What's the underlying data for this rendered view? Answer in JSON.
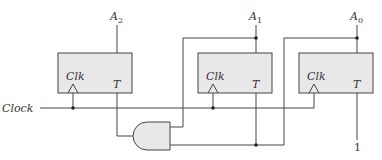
{
  "diagram": {
    "type": "logic-circuit",
    "clock_label": "Clock",
    "flip_flops": [
      {
        "output_name": "A",
        "output_sub": "2",
        "clk_label": "Clk",
        "input_label": "T"
      },
      {
        "output_name": "A",
        "output_sub": "1",
        "clk_label": "Clk",
        "input_label": "T"
      },
      {
        "output_name": "A",
        "output_sub": "0",
        "clk_label": "Clk",
        "input_label": "T"
      }
    ],
    "gates": [
      {
        "type": "AND",
        "inputs": [
          "A1",
          "A0"
        ],
        "output": "T of A2"
      }
    ],
    "constant_input": "1",
    "colors": {
      "box_fill": "#e8e8e8",
      "line": "#444444"
    }
  }
}
